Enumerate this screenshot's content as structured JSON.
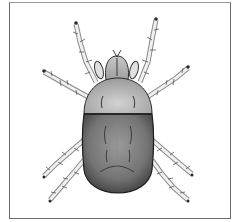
{
  "image": {
    "subject": "mite illustration",
    "description": "Dorsal view drawing of a mite with eight bristled legs, rounded grey body divided into lighter front and darker rear sections, enclosed in a thin rectangular frame",
    "colors": {
      "frame": "#6a6a6a",
      "background": "#ffffff",
      "front_body": "#bdbdbd",
      "rear_body": "#7a7a7a",
      "outline": "#2a2a2a"
    }
  }
}
